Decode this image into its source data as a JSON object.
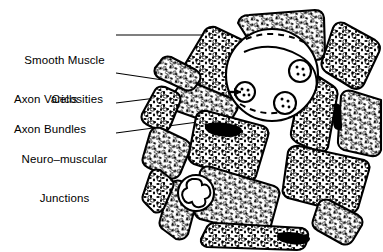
{
  "figure": {
    "type": "histology-diagram",
    "background_color": "#ffffff",
    "ink_color": "#000000",
    "labels": [
      {
        "id": "smooth-muscle-cells",
        "line1": "Smooth Muscle",
        "line2": "Cells",
        "x": 14,
        "y": 28,
        "width": 101,
        "align": "center",
        "leader": {
          "x1": 116,
          "y1": 35,
          "x2": 206,
          "y2": 35
        }
      },
      {
        "id": "axon-varicosities",
        "line1": "Axon Varicosities",
        "line2": "",
        "x": 14,
        "y": 67,
        "width": 101,
        "align": "left",
        "leader": {
          "x1": 116,
          "y1": 73,
          "x2": 243,
          "y2": 92
        }
      },
      {
        "id": "axon-bundles",
        "line1": "Axon Bundles",
        "line2": "",
        "x": 14,
        "y": 97,
        "width": 101,
        "align": "left",
        "leader": {
          "x1": 116,
          "y1": 103,
          "x2": 196,
          "y2": 93
        }
      },
      {
        "id": "neuro-muscular-junctions",
        "line1": "Neuro–muscular",
        "line2": "Junctions",
        "x": 14,
        "y": 127,
        "width": 101,
        "align": "center",
        "leader": {
          "x1": 116,
          "y1": 133,
          "x2": 198,
          "y2": 122
        }
      }
    ],
    "structures": {
      "smooth_muscle_cells_count": 16,
      "axon_bundle_count": 1,
      "axon_varicosity_count": 3,
      "neuromuscular_junction_count": 1,
      "nuclei_visible_count": 3
    }
  }
}
